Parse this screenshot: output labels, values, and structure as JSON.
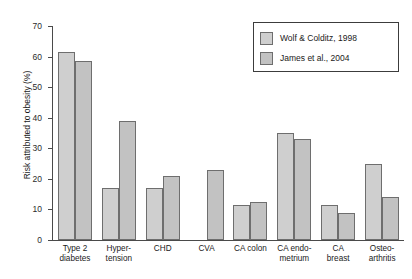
{
  "chart_data": {
    "type": "bar",
    "title": "",
    "xlabel": "",
    "ylabel": "Risk attributed to obesity (%)",
    "ylim": [
      0,
      70
    ],
    "yticks": [
      0,
      10,
      20,
      30,
      40,
      50,
      60,
      70
    ],
    "grid": false,
    "legend_position": "top-right",
    "categories": [
      "Type 2 diabetes",
      "Hyper-tension",
      "CHD",
      "CVA",
      "CA colon",
      "CA endo-metrium",
      "CA breast",
      "Osteo-arthritis"
    ],
    "category_lines": [
      [
        "Type 2",
        "diabetes"
      ],
      [
        "Hyper-",
        "tension"
      ],
      [
        "CHD",
        ""
      ],
      [
        "CVA",
        ""
      ],
      [
        "CA colon",
        ""
      ],
      [
        "CA endo-",
        "metrium"
      ],
      [
        "CA",
        "breast"
      ],
      [
        "Osteo-",
        "arthritis"
      ]
    ],
    "series": [
      {
        "name": "Wolf & Colditz, 1998",
        "color": "#cfcfcf",
        "values": [
          61.5,
          17,
          17,
          null,
          11.5,
          35,
          11.5,
          25
        ]
      },
      {
        "name": "James et al., 2004",
        "color": "#c2c2c2",
        "values": [
          58.5,
          39,
          21,
          23,
          12.5,
          33,
          9,
          14
        ]
      }
    ]
  },
  "legend": {
    "items": [
      {
        "label": "Wolf & Colditz, 1998"
      },
      {
        "label": "James et al., 2004"
      }
    ]
  }
}
